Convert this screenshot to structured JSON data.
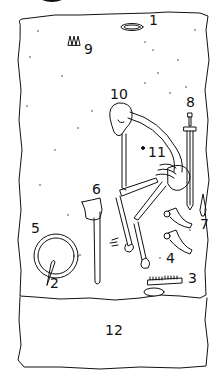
{
  "figure": {
    "type": "grave-plan",
    "line_color": "#111111",
    "background": "#ffffff"
  },
  "labels": {
    "item1": "1",
    "item2": "2",
    "item3": "3",
    "item4": "4",
    "item5": "5",
    "item6": "6",
    "item7": "7",
    "item8": "8",
    "item9": "9",
    "item10": "10",
    "item11": "11",
    "item12": "12"
  },
  "items": [
    {
      "id": "1",
      "name": "oval-object"
    },
    {
      "id": "2",
      "name": "shield-boss-spike"
    },
    {
      "id": "3",
      "name": "comb"
    },
    {
      "id": "4",
      "name": "stirrups"
    },
    {
      "id": "5",
      "name": "shield"
    },
    {
      "id": "6",
      "name": "axe"
    },
    {
      "id": "7",
      "name": "spearhead"
    },
    {
      "id": "8",
      "name": "sword"
    },
    {
      "id": "9",
      "name": "arrowheads"
    },
    {
      "id": "10",
      "name": "skull"
    },
    {
      "id": "11",
      "name": "small-object"
    },
    {
      "id": "12",
      "name": "lower-section"
    }
  ]
}
